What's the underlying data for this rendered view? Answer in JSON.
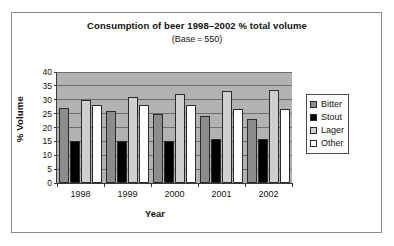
{
  "chart_data": {
    "type": "bar",
    "title": "Consumption of beer 1998–2002 % total volume",
    "subtitle": "(Base = 550)",
    "xlabel": "Year",
    "ylabel": "% Volume",
    "categories": [
      "1998",
      "1999",
      "2000",
      "2001",
      "2002"
    ],
    "ylim": [
      0,
      40
    ],
    "yticks": [
      0,
      5,
      10,
      15,
      20,
      25,
      30,
      35,
      40
    ],
    "ytick_labels": [
      "0",
      "5",
      "10",
      "15",
      "20",
      "25",
      "30",
      "35",
      "40"
    ],
    "grid": true,
    "legend_position": "right",
    "plot_background": "#b2b2b2",
    "series": [
      {
        "name": "Bitter",
        "color": "#8c8c8c",
        "values": [
          27,
          26,
          25,
          24,
          23
        ]
      },
      {
        "name": "Stout",
        "color": "#000000",
        "values": [
          15,
          15,
          15,
          16,
          16
        ]
      },
      {
        "name": "Lager",
        "color": "#cfcfcf",
        "values": [
          30,
          31,
          32,
          33,
          33.5
        ]
      },
      {
        "name": "Other",
        "color": "#ffffff",
        "values": [
          28,
          28,
          28,
          26.5,
          26.5
        ]
      }
    ]
  },
  "legend": {
    "entries": [
      {
        "label": "Bitter",
        "color": "#8c8c8c"
      },
      {
        "label": "Stout",
        "color": "#000000"
      },
      {
        "label": "Lager",
        "color": "#cfcfcf"
      },
      {
        "label": "Other",
        "color": "#ffffff"
      }
    ]
  }
}
